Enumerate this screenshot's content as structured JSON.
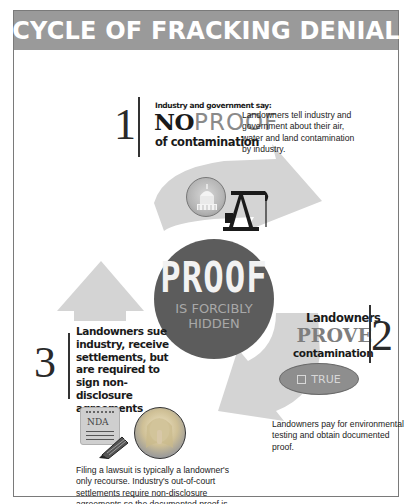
{
  "title": "CYCLE OF FRACKING DENIAL",
  "center": {
    "big": "PROOF",
    "small_line1": "IS FORCIBLY",
    "small_line2": "HIDDEN"
  },
  "steps": [
    {
      "number": "1",
      "heading": "Industry and government say:",
      "big_part1": "NO",
      "big_part2": "PROOF",
      "sub": "of contamination",
      "description": "Landowners tell industry and government about their air, water and land contamination by industry.",
      "icons": [
        "capitol-dome-icon",
        "oil-pump-jack-icon"
      ]
    },
    {
      "number": "2",
      "heading": "Landowners",
      "big": "PROVE",
      "sub": "contamination",
      "badge_label": "TRUE",
      "description": "Landowners pay for environmental testing and obtain documented proof.",
      "icons": [
        "checkbox-icon"
      ]
    },
    {
      "number": "3",
      "heading": "Landowners sue industry, receive settlements, but are required to sign non-disclosure agreements",
      "nda_label": "NDA",
      "description": "Filing a lawsuit is typically a landowner's only recourse. Industry's out-of-court settlements require non-disclosure agreements so the documented proof is hidden away from public.",
      "icons": [
        "nda-notepad-icon",
        "pencil-icon",
        "silenced-woman-portrait"
      ]
    }
  ],
  "colors": {
    "title_bar": "#9a9a9a",
    "arrow_fill": "#d4d4d4",
    "circle_fill": "#5c5c5c",
    "frame_border": "#7a7a7a"
  }
}
